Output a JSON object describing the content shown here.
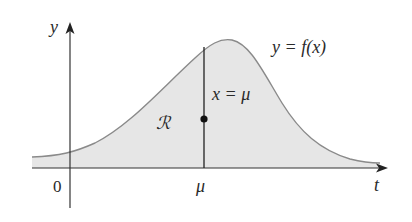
{
  "diagram": {
    "axis_labels": {
      "y": "y",
      "x": "t"
    },
    "origin_label": "0",
    "mu_tick_label": "μ",
    "curve_label": "y = f(x)",
    "line_label": "x = μ",
    "region_label": "ℛ",
    "colors": {
      "fill": "#e6e6e6",
      "curve": "#8a8a8a",
      "axis": "#333333",
      "line": "#222222",
      "text": "#2a2a2a"
    }
  }
}
